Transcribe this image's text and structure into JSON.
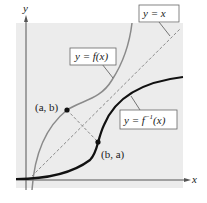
{
  "diagram": {
    "axes": {
      "x_label": "x",
      "y_label": "y"
    },
    "labels": {
      "identity_line": "y = x",
      "function": "y = f(x)",
      "inverse_prefix": "y = f",
      "inverse_superscript": "−1",
      "inverse_suffix": "(x)",
      "point_ab": "(a, b)",
      "point_ba": "(b, a)"
    },
    "colors": {
      "background_shade": "#ececec",
      "function_curve": "#8a8a8a",
      "inverse_curve": "#111111",
      "identity_line": "#8a8a8a",
      "axis": "#555555"
    }
  }
}
